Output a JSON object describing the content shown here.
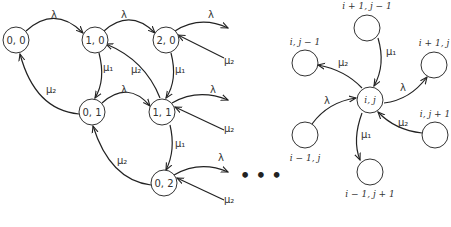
{
  "left_diagram": {
    "nodes": [
      {
        "id": "0,0",
        "label": "0, 0"
      },
      {
        "id": "1,0",
        "label": "1, 0"
      },
      {
        "id": "2,0",
        "label": "2, 0"
      },
      {
        "id": "0,1",
        "label": "0, 1"
      },
      {
        "id": "1,1",
        "label": "1, 1"
      },
      {
        "id": "0,2",
        "label": "0, 2"
      }
    ],
    "edge_labels": {
      "lambda": "λ",
      "mu1": "μ₁",
      "mu2": "μ₂"
    },
    "continuation": "• • •"
  },
  "right_diagram": {
    "center": "i, j",
    "top": "i + 1, j − 1",
    "left": "i, j − 1",
    "right": "i + 1, j",
    "lower_left": "i − 1, j",
    "lower_right": "i, j + 1",
    "bottom": "i − 1, j + 1",
    "edge_labels": {
      "mu1_top": "μ₁",
      "mu2_left": "μ₂",
      "lambda_right": "λ",
      "lambda_in": "λ",
      "mu1_bottom": "μ₁",
      "mu2_in": "μ₂"
    }
  }
}
